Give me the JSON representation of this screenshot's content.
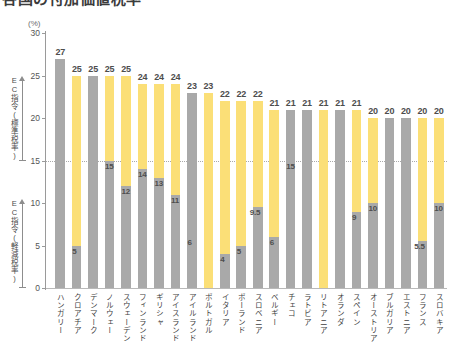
{
  "title": "各国の付加価値税率",
  "axis": {
    "unit": "(%)",
    "ticks": [
      0,
      5,
      10,
      15,
      20,
      25,
      30
    ],
    "ymin": 0,
    "ymax": 30
  },
  "annotations": {
    "standard_bracket": "EC指令(標準税率)",
    "reduced_bracket": "EC指令(軽減税率)",
    "reference_line_value": 15
  },
  "colors": {
    "standard_yellow": "#FBDF77",
    "standard_gray": "#A9A9A9",
    "reduced_gray": "#A9A9A9",
    "axis": "#9A9A9A",
    "text": "#4D4D4D",
    "reference_line": "#A9A9A9"
  },
  "chart_data": {
    "type": "bar",
    "title": "各国の付加価値税率",
    "xlabel": "",
    "ylabel": "(%)",
    "ylim": [
      0,
      30
    ],
    "grid": false,
    "legend_position": "none",
    "categories": [
      "ハンガリー",
      "クロアチア",
      "デンマーク",
      "ノルウェー",
      "スウェーデン",
      "フィンランド",
      "ギリシャ",
      "アイスランド",
      "アイルランド",
      "ポルトガル",
      "イタリア",
      "ポーランド",
      "スロベニア",
      "ベルギー",
      "チェコ",
      "ラトビア",
      "リトアニア",
      "オランダ",
      "スペイン",
      "オーストリア",
      "ブルガリア",
      "エストニア",
      "フランス",
      "スロバキア"
    ],
    "series": [
      {
        "name": "標準税率",
        "values": [
          27,
          25,
          25,
          25,
          25,
          24,
          24,
          24,
          23,
          23,
          22,
          22,
          22,
          21,
          21,
          21,
          21,
          21,
          21,
          20,
          20,
          20,
          20,
          20
        ]
      },
      {
        "name": "軽減税率",
        "values": [
          null,
          5,
          null,
          15,
          12,
          14,
          13,
          11,
          6,
          null,
          4,
          5,
          9.5,
          6,
          15,
          null,
          null,
          null,
          9,
          10,
          null,
          null,
          5.5,
          10
        ]
      }
    ],
    "bar_fill_types": [
      "gray",
      "yellow",
      "gray",
      "yellow",
      "yellow",
      "yellow",
      "yellow",
      "yellow",
      "gray",
      "yellow",
      "yellow",
      "yellow",
      "yellow",
      "yellow",
      "gray",
      "gray",
      "yellow",
      "gray",
      "yellow",
      "yellow",
      "gray",
      "gray",
      "yellow",
      "yellow"
    ],
    "standard_labels": [
      "27",
      "25",
      "25",
      "25",
      "25",
      "24",
      "24",
      "24",
      "23",
      "23",
      "22",
      "22",
      "22",
      "21",
      "21",
      "21",
      "21",
      "21",
      "21",
      "20",
      "20",
      "20",
      "20",
      "20"
    ],
    "reduced_labels": [
      "",
      "5",
      "",
      "15",
      "12",
      "14",
      "13",
      "11",
      "6",
      "",
      "4",
      "5",
      "9.5",
      "6",
      "15",
      "",
      "",
      "",
      "9",
      "10",
      "",
      "",
      "5.5",
      "10"
    ]
  }
}
